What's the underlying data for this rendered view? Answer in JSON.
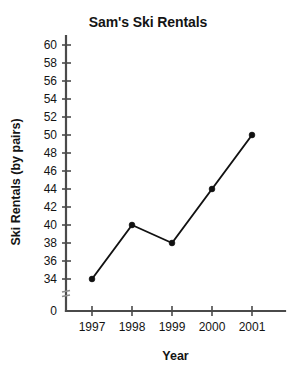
{
  "chart_data": {
    "type": "line",
    "title": "Sam's Ski Rentals",
    "xlabel": "Year",
    "ylabel": "Ski Rentals (by pairs)",
    "categories": [
      "1997",
      "1998",
      "1999",
      "2000",
      "2001"
    ],
    "values": [
      34,
      40,
      38,
      44,
      50
    ],
    "series": [
      {
        "name": "Ski Rentals",
        "values": [
          34,
          40,
          38,
          44,
          50
        ]
      }
    ],
    "ytick_labels": [
      "0",
      "34",
      "36",
      "38",
      "40",
      "42",
      "44",
      "46",
      "48",
      "50",
      "52",
      "54",
      "56",
      "58",
      "60"
    ],
    "ylim": [
      34,
      60
    ],
    "ystep": 2,
    "y_axis_break": true,
    "y_axis_break_label": "axis-break",
    "grid": false,
    "legend": false,
    "legend_position": "none",
    "marker": "filled-circle",
    "line_color": "#111111",
    "axis_color": "#4a4a4a",
    "background_color": "#ffffff",
    "zero_baseline_label": "0"
  }
}
